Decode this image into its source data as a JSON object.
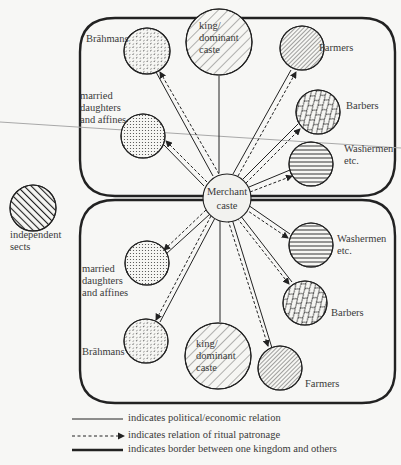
{
  "diagram": {
    "type": "relation-network",
    "center": {
      "label_line1": "Merchant",
      "label_line2": "caste"
    },
    "outside": {
      "label_line1": "independent",
      "label_line2": "sects"
    },
    "upper_kingdom": {
      "brahmans": "Brāhmans",
      "king_line1": "king/",
      "king_line2": "dominant",
      "king_line3": "caste",
      "farmers": "Farmers",
      "barbers": "Barbers",
      "washermen_line1": "Washermen",
      "washermen_line2": "etc.",
      "married_line1": "married",
      "married_line2": "daughters",
      "married_line3": "and affines"
    },
    "lower_kingdom": {
      "brahmans": "Brāhmans",
      "king_line1": "king/",
      "king_line2": "dominant",
      "king_line3": "caste",
      "farmers": "Farmers",
      "barbers": "Barbers",
      "washermen_line1": "Washermen",
      "washermen_line2": "etc.",
      "married_line1": "married",
      "married_line2": "daughters",
      "married_line3": "and affines"
    }
  },
  "legend": {
    "solid": "indicates political/economic relation",
    "dashed": "indicates relation of ritual patronage",
    "border": "indicates border between one kingdom and others"
  },
  "colors": {
    "line": "#2a2a2a",
    "fill": "#f3f3f0",
    "stray_line": "#9a9a9a"
  }
}
